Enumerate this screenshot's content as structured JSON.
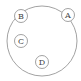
{
  "diagram": {
    "type": "nested-circles",
    "outer_circle": {
      "cx": 42,
      "cy": 41,
      "r": 35
    },
    "nodes": [
      {
        "label": "A",
        "cx": 68,
        "cy": 15,
        "r": 6.5
      },
      {
        "label": "B",
        "cx": 21,
        "cy": 16,
        "r": 6.5
      },
      {
        "label": "C",
        "cx": 21,
        "cy": 41,
        "r": 6.5
      },
      {
        "label": "D",
        "cx": 42,
        "cy": 62,
        "r": 6.5
      }
    ],
    "colors": {
      "stroke": "#8a8a8a",
      "text": "#444444",
      "background": "#ffffff"
    }
  }
}
